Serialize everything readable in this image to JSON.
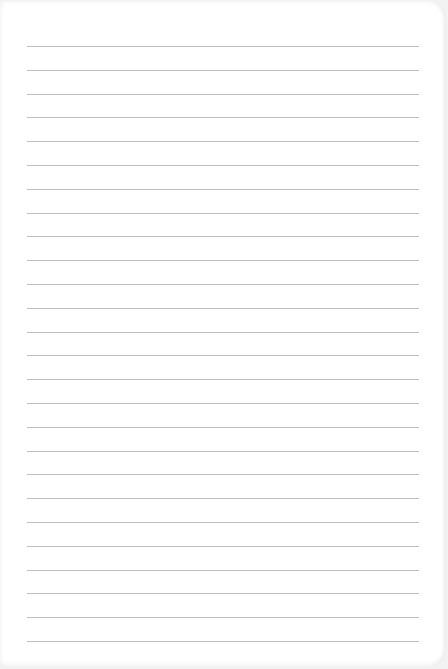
{
  "paper": {
    "type": "lined-notebook-page",
    "line_count": 26,
    "first_line_y": 46,
    "line_spacing": 23.8,
    "line_left": 27,
    "line_width": 392,
    "line_color": "#bdbdbd",
    "paper_color": "#ffffff"
  }
}
